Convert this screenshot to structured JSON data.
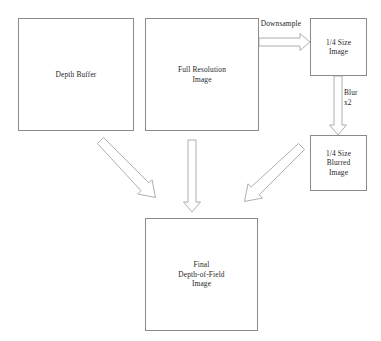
{
  "diagram": {
    "background_color": "#ffffff",
    "box_border_color": "#8a8a8a",
    "arrow_stroke_color": "#9a9a9a",
    "arrow_fill_color": "#ffffff",
    "text_color": "#1f1f1f",
    "nodes": [
      {
        "id": "depth-buffer",
        "label": "Depth Buffer",
        "x": 18,
        "y": 18,
        "width": 116,
        "height": 113
      },
      {
        "id": "full-resolution-image",
        "label": "Full Resolution\nImage",
        "x": 145,
        "y": 18,
        "width": 114,
        "height": 113
      },
      {
        "id": "quarter-size-image",
        "label": "1/4 Size\nImage",
        "x": 310,
        "y": 18,
        "width": 57,
        "height": 58
      },
      {
        "id": "quarter-size-blurred-image",
        "label": "1/4 Size\nBlurred\nImage",
        "x": 310,
        "y": 135,
        "width": 57,
        "height": 56
      },
      {
        "id": "final-depth-of-field-image",
        "label": "Final\nDepth-of-Field\nImage",
        "x": 145,
        "y": 218,
        "width": 113,
        "height": 113
      }
    ],
    "edges": [
      {
        "id": "downsample-arrow",
        "label": "Downsample",
        "from": "full-resolution-image",
        "to": "quarter-size-image",
        "direction": "right"
      },
      {
        "id": "blur-arrow",
        "label": "Blur\nx2",
        "from": "quarter-size-image",
        "to": "quarter-size-blurred-image",
        "direction": "down"
      },
      {
        "id": "depth-buffer-to-final-arrow",
        "label": "",
        "from": "depth-buffer",
        "to": "final-depth-of-field-image",
        "direction": "down-right"
      },
      {
        "id": "full-resolution-to-final-arrow",
        "label": "",
        "from": "full-resolution-image",
        "to": "final-depth-of-field-image",
        "direction": "down"
      },
      {
        "id": "blurred-to-final-arrow",
        "label": "",
        "from": "quarter-size-blurred-image",
        "to": "final-depth-of-field-image",
        "direction": "down-left"
      }
    ],
    "edge_labels": {
      "downsample": "Downsample",
      "blur": "Blur\nx2"
    }
  }
}
